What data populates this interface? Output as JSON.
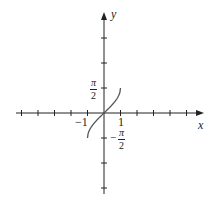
{
  "chart_data": {
    "type": "line",
    "title": "",
    "function": "y = arcsin(x)",
    "xlabel": "x",
    "ylabel": "y",
    "x_tick_labels": [
      "-1",
      "1"
    ],
    "y_tick_labels": [
      "π/2",
      "-π/2"
    ],
    "xlim": [
      -6,
      6
    ],
    "ylim": [
      -3.5,
      4
    ],
    "x_tick_count_each_side": 6,
    "y_tick_count_each_side": 3,
    "grid": false,
    "series": [
      {
        "name": "arcsin(x)",
        "x": [
          -1,
          -0.9,
          -0.75,
          -0.5,
          -0.25,
          0,
          0.25,
          0.5,
          0.75,
          0.9,
          1
        ],
        "values": [
          -1.5708,
          -1.1198,
          -0.8481,
          -0.5236,
          -0.2527,
          0,
          0.2527,
          0.5236,
          0.8481,
          1.1198,
          1.5708
        ]
      }
    ],
    "colors": {
      "axis": "#222222",
      "curve": "#555555"
    }
  },
  "labels": {
    "x_axis": "x",
    "y_axis": "y",
    "x_neg_one": "−1",
    "x_pos_one": "1",
    "pi_num": "π",
    "pi_den": "2",
    "minus": "−"
  }
}
